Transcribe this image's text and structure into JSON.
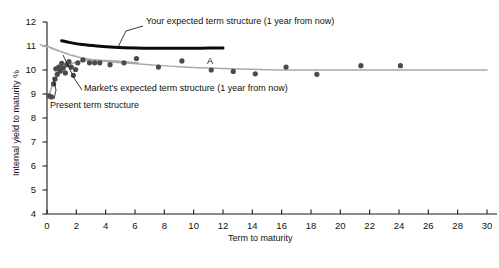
{
  "figure": {
    "background": "#ffffff",
    "axis_color": "#1a1a1a",
    "series_colors": {
      "your_expected": "#0b0b0b",
      "market_expected": "#a8a8a8",
      "present": "#a8a8a8",
      "points": "#4a4a4a"
    }
  },
  "axes": {
    "x": {
      "label": "Term to maturity",
      "min": 0,
      "max": 30,
      "ticks": [
        0,
        2,
        4,
        6,
        8,
        10,
        12,
        14,
        16,
        18,
        20,
        22,
        24,
        26,
        28,
        30
      ],
      "tick_labels": [
        "0",
        "2",
        "4",
        "6",
        "8",
        "10",
        "12",
        "14",
        "16",
        "18",
        "20",
        "22",
        "24",
        "26",
        "28",
        "30"
      ]
    },
    "y": {
      "label": "Internal yield to maturity %",
      "min": 4,
      "max": 12,
      "ticks": [
        4,
        5,
        6,
        7,
        8,
        9,
        10,
        11,
        12
      ],
      "tick_labels": [
        "4",
        "5",
        "6",
        "7",
        "8",
        "9",
        "10",
        "11",
        "12"
      ]
    },
    "grid": false,
    "legend_position": "none"
  },
  "annotations": [
    {
      "name": "your-expected-term-structure",
      "text": "Your expected term structure (1 year from now)",
      "text_x": 146,
      "text_y": 17,
      "leader": [
        [
          143,
          26
        ],
        [
          126,
          31
        ],
        [
          118,
          47
        ]
      ]
    },
    {
      "name": "markets-expected-term-structure",
      "text": "Market's expected term structure (1 year from now)",
      "text_x": 84,
      "text_y": 84,
      "leader": [
        [
          82,
          90
        ],
        [
          74,
          78
        ],
        [
          63,
          55
        ]
      ]
    },
    {
      "name": "present-term-structure",
      "text": "Present term structure",
      "text_x": 50,
      "text_y": 101,
      "leader": [
        [
          54,
          99
        ],
        [
          56,
          90
        ],
        [
          53,
          77
        ]
      ]
    },
    {
      "name": "point-a-label",
      "text": "A",
      "text_x": 207,
      "text_y": 57,
      "leader": null
    }
  ],
  "chart_data": {
    "type": "scatter",
    "title": "",
    "xlabel": "Term to maturity",
    "ylabel": "Internal yield to maturity %",
    "xlim": [
      0,
      30
    ],
    "ylim": [
      4,
      12
    ],
    "grid": false,
    "series": [
      {
        "name": "Observed bond yields",
        "type": "scatter",
        "color": "#4a4a4a",
        "marker": "filled-circle",
        "points": [
          [
            0.15,
            8.92
          ],
          [
            0.3,
            8.88
          ],
          [
            0.45,
            9.42
          ],
          [
            0.55,
            9.62
          ],
          [
            0.6,
            10.05
          ],
          [
            0.7,
            9.82
          ],
          [
            0.8,
            10.12
          ],
          [
            0.9,
            9.95
          ],
          [
            1.0,
            10.28
          ],
          [
            1.1,
            10.08
          ],
          [
            1.25,
            9.88
          ],
          [
            1.35,
            10.22
          ],
          [
            1.5,
            10.35
          ],
          [
            1.65,
            10.12
          ],
          [
            1.8,
            9.78
          ],
          [
            1.95,
            10.02
          ],
          [
            2.1,
            10.3
          ],
          [
            2.45,
            10.42
          ],
          [
            2.9,
            10.3
          ],
          [
            3.25,
            10.3
          ],
          [
            3.6,
            10.3
          ],
          [
            4.3,
            10.22
          ],
          [
            5.25,
            10.3
          ],
          [
            6.1,
            10.48
          ],
          [
            7.6,
            10.12
          ],
          [
            9.2,
            10.38
          ],
          [
            11.2,
            10.0
          ],
          [
            12.7,
            9.94
          ],
          [
            14.2,
            9.84
          ],
          [
            16.3,
            10.12
          ],
          [
            18.4,
            9.82
          ],
          [
            21.4,
            10.18
          ],
          [
            24.1,
            10.18
          ]
        ]
      },
      {
        "name": "Your expected term structure (1 year from now)",
        "type": "line",
        "color": "#0b0b0b",
        "style": "solid-thick",
        "points": [
          [
            1.0,
            11.22
          ],
          [
            1.6,
            11.14
          ],
          [
            2.4,
            11.06
          ],
          [
            3.4,
            11.0
          ],
          [
            4.6,
            10.95
          ],
          [
            6.0,
            10.92
          ],
          [
            7.5,
            10.91
          ],
          [
            9.0,
            10.91
          ],
          [
            10.5,
            10.91
          ],
          [
            12.0,
            10.92
          ]
        ]
      },
      {
        "name": "Market's expected term structure (1 year from now)",
        "type": "line",
        "color": "#a8a8a8",
        "style": "solid",
        "points": [
          [
            0.0,
            11.0
          ],
          [
            0.8,
            10.8
          ],
          [
            1.6,
            10.62
          ],
          [
            2.6,
            10.48
          ],
          [
            3.8,
            10.38
          ],
          [
            5.2,
            10.3
          ],
          [
            7.0,
            10.22
          ],
          [
            9.0,
            10.14
          ],
          [
            11.5,
            10.07
          ],
          [
            14.0,
            10.03
          ],
          [
            17.0,
            10.0
          ],
          [
            21.0,
            10.0
          ],
          [
            25.0,
            10.0
          ],
          [
            30.0,
            10.0
          ]
        ]
      },
      {
        "name": "Present term structure",
        "type": "line",
        "color": "#a8a8a8",
        "style": "solid",
        "points": [
          [
            0.1,
            8.9
          ],
          [
            0.3,
            9.25
          ],
          [
            0.5,
            9.55
          ],
          [
            0.75,
            9.82
          ],
          [
            1.05,
            10.02
          ],
          [
            1.4,
            10.18
          ],
          [
            1.85,
            10.3
          ],
          [
            2.4,
            10.38
          ],
          [
            3.1,
            10.41
          ],
          [
            4.0,
            10.4
          ],
          [
            5.0,
            10.36
          ],
          [
            6.2,
            10.3
          ]
        ]
      },
      {
        "name": "Present term structure (dashed extension)",
        "type": "line",
        "color": "#b0b0b0",
        "style": "dashed",
        "points": [
          [
            -0.45,
            11.05
          ],
          [
            1.2,
            10.72
          ],
          [
            2.6,
            10.46
          ],
          [
            3.6,
            10.32
          ]
        ]
      }
    ],
    "point_labels": [
      {
        "label": "A",
        "x": 21.4,
        "y": 10.18
      }
    ]
  }
}
